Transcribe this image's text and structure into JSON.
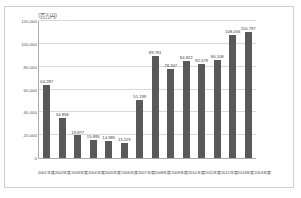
{
  "figure": {
    "unit_label": "（百万円）",
    "background_color": "#ffffff",
    "border_color": "#d0d0d0",
    "bar_color": "#595959",
    "gridline_color": "#d9d9d9",
    "axis_color": "#aaaaaa"
  },
  "chart_data": {
    "type": "bar",
    "title": "",
    "subtitle": "",
    "xlabel": "",
    "ylabel": "（百万円）",
    "ylim": [
      0,
      120000
    ],
    "ytick_labels": [
      "120,000",
      "100,000",
      "80,000",
      "60,000",
      "40,000",
      "20,000",
      "0"
    ],
    "ytick_values": [
      120000,
      100000,
      80000,
      60000,
      40000,
      20000,
      0
    ],
    "grid": true,
    "legend": null,
    "categories": [
      "2001年度",
      "2002年度",
      "2003年度",
      "2004年度",
      "2005年度",
      "2006年度",
      "2007年度",
      "2008年度",
      "2009年度",
      "2010年度",
      "2011年度",
      "2012年度",
      "2013年度",
      "2014年度"
    ],
    "values": [
      64287,
      34858,
      19877,
      15895,
      14985,
      13119,
      51199,
      89781,
      78347,
      84822,
      82679,
      86108,
      108056,
      110797
    ],
    "data_labels": [
      "64,287",
      "34,858",
      "19,877",
      "15,895",
      "14,985",
      "13,119",
      "51,199",
      "89,781",
      "78,347",
      "84,822",
      "82,679",
      "86,108",
      "108,056",
      "110,797"
    ]
  }
}
